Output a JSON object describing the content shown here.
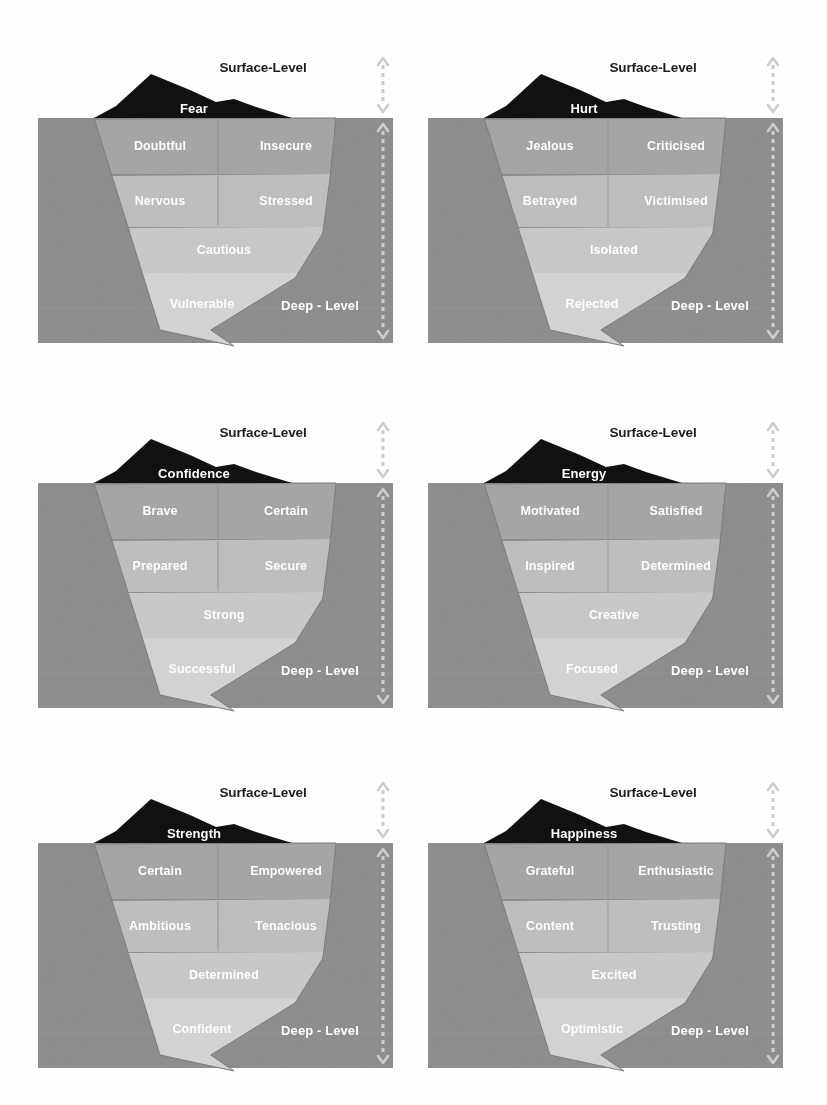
{
  "page": {
    "background_color": "#ffffff"
  },
  "legend": {
    "surface_label": "Surface-Level",
    "deep_label": "Deep - Level",
    "surface_arrow_icon": "double-headed-dashed-arrow-vertical",
    "deep_arrow_icon": "double-headed-dashed-arrow-vertical"
  },
  "palette": {
    "tip": "#111111",
    "water": "#8f8f8f",
    "band1": "#a6a6a6",
    "band2": "#bfbfbf",
    "band3": "#c9c9c9",
    "band4": "#d4d4d4",
    "divider": "#8c8c8c",
    "arrow": "#cfcfcf",
    "surface_text": "#1d1d1d",
    "tier_text": "#ffffff"
  },
  "panels": [
    {
      "id": "fear",
      "core_emotion": "Fear",
      "surface_label": "Surface-Level",
      "deep_label": "Deep - Level",
      "tiers": [
        {
          "row": 1,
          "cells": [
            "Doubtful",
            "Insecure"
          ]
        },
        {
          "row": 2,
          "cells": [
            "Nervous",
            "Stressed"
          ]
        },
        {
          "row": 3,
          "cells": [
            "Cautious"
          ]
        },
        {
          "row": 4,
          "cells": [
            "Vulnerable"
          ]
        }
      ]
    },
    {
      "id": "hurt",
      "core_emotion": "Hurt",
      "surface_label": "Surface-Level",
      "deep_label": "Deep - Level",
      "tiers": [
        {
          "row": 1,
          "cells": [
            "Jealous",
            "Criticised"
          ]
        },
        {
          "row": 2,
          "cells": [
            "Betrayed",
            "Victimised"
          ]
        },
        {
          "row": 3,
          "cells": [
            "Isolated"
          ]
        },
        {
          "row": 4,
          "cells": [
            "Rejected"
          ]
        }
      ]
    },
    {
      "id": "confidence",
      "core_emotion": "Confidence",
      "surface_label": "Surface-Level",
      "deep_label": "Deep - Level",
      "tiers": [
        {
          "row": 1,
          "cells": [
            "Brave",
            "Certain"
          ]
        },
        {
          "row": 2,
          "cells": [
            "Prepared",
            "Secure"
          ]
        },
        {
          "row": 3,
          "cells": [
            "Strong"
          ]
        },
        {
          "row": 4,
          "cells": [
            "Successful"
          ]
        }
      ]
    },
    {
      "id": "energy",
      "core_emotion": "Energy",
      "surface_label": "Surface-Level",
      "deep_label": "Deep - Level",
      "tiers": [
        {
          "row": 1,
          "cells": [
            "Motivated",
            "Satisfied"
          ]
        },
        {
          "row": 2,
          "cells": [
            "Inspired",
            "Determined"
          ]
        },
        {
          "row": 3,
          "cells": [
            "Creative"
          ]
        },
        {
          "row": 4,
          "cells": [
            "Focused"
          ]
        }
      ]
    },
    {
      "id": "strength",
      "core_emotion": "Strength",
      "surface_label": "Surface-Level",
      "deep_label": "Deep - Level",
      "tiers": [
        {
          "row": 1,
          "cells": [
            "Certain",
            "Empowered"
          ]
        },
        {
          "row": 2,
          "cells": [
            "Ambitious",
            "Tenacious"
          ]
        },
        {
          "row": 3,
          "cells": [
            "Determined"
          ]
        },
        {
          "row": 4,
          "cells": [
            "Confident"
          ]
        }
      ]
    },
    {
      "id": "happiness",
      "core_emotion": "Happiness",
      "surface_label": "Surface-Level",
      "deep_label": "Deep - Level",
      "tiers": [
        {
          "row": 1,
          "cells": [
            "Grateful",
            "Enthusiastic"
          ]
        },
        {
          "row": 2,
          "cells": [
            "Content",
            "Trusting"
          ]
        },
        {
          "row": 3,
          "cells": [
            "Excited"
          ]
        },
        {
          "row": 4,
          "cells": [
            "Optimistic"
          ]
        }
      ]
    }
  ]
}
